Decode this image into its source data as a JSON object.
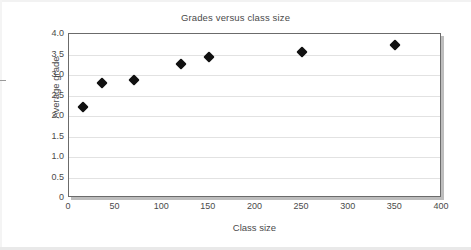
{
  "chart_data": {
    "type": "scatter",
    "title": "Grades versus class size",
    "xlabel": "Class size",
    "ylabel": "Average grade",
    "xlim": [
      0,
      400
    ],
    "ylim": [
      0,
      4.0
    ],
    "grid": true,
    "legend": false,
    "x_ticks": [
      "0",
      "50",
      "100",
      "150",
      "200",
      "250",
      "300",
      "350",
      "400"
    ],
    "x_tick_values": [
      0,
      50,
      100,
      150,
      200,
      250,
      300,
      350,
      400
    ],
    "y_ticks": [
      "0",
      "0.5",
      "1.0",
      "1.5",
      "2.0",
      "2.5",
      "3.0",
      "3.5",
      "4.0"
    ],
    "y_tick_values": [
      0,
      0.5,
      1.0,
      1.5,
      2.0,
      2.5,
      3.0,
      3.5,
      4.0
    ],
    "marker_style": "diamond",
    "marker_color": "#111111",
    "series": [
      {
        "name": "Average grade",
        "points": [
          {
            "x": 15,
            "y": 2.22
          },
          {
            "x": 35,
            "y": 2.8
          },
          {
            "x": 70,
            "y": 2.88
          },
          {
            "x": 120,
            "y": 3.27
          },
          {
            "x": 150,
            "y": 3.44
          },
          {
            "x": 250,
            "y": 3.56
          },
          {
            "x": 350,
            "y": 3.73
          }
        ]
      }
    ]
  }
}
